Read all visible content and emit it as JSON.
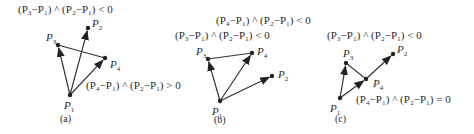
{
  "figures": [
    {
      "id": "a",
      "caption": "(a)",
      "points": {
        "P1": {
          "x": 70,
          "y": 95,
          "label": "P",
          "sub": "1"
        },
        "P2": {
          "x": 88,
          "y": 28,
          "label": "P",
          "sub": "2"
        },
        "P3": {
          "x": 58,
          "y": 45,
          "label": "P",
          "sub": "3"
        },
        "P4": {
          "x": 105,
          "y": 58,
          "label": "P",
          "sub": "4"
        }
      },
      "labels": [
        {
          "text": "(P₃−P₁) ^ (P₂−P₁) < 0",
          "x": 18,
          "y": 13
        },
        {
          "text": "(P₄−P₁) ^ (P₂−P₁) > 0",
          "x": 86,
          "y": 89
        }
      ]
    },
    {
      "id": "b",
      "caption": "(b)",
      "points": {
        "P1": {
          "x": 220,
          "y": 101,
          "label": "P",
          "sub": "1"
        },
        "P2": {
          "x": 272,
          "y": 76,
          "label": "P",
          "sub": "2"
        },
        "P3": {
          "x": 208,
          "y": 59,
          "label": "P",
          "sub": "3"
        },
        "P4": {
          "x": 252,
          "y": 53,
          "label": "P",
          "sub": "4"
        }
      },
      "labels": [
        {
          "text": "(P₄−P₁) ^ (P₂−P₁) < 0",
          "x": 216,
          "y": 24
        },
        {
          "text": "(P₃−P₁) ^ (P₂−P₁) < 0",
          "x": 175,
          "y": 39
        }
      ]
    },
    {
      "id": "c",
      "caption": "(c)",
      "points": {
        "P1": {
          "x": 340,
          "y": 98,
          "label": "P",
          "sub": "1"
        },
        "P2": {
          "x": 393,
          "y": 54,
          "label": "P",
          "sub": "2"
        },
        "P3": {
          "x": 346,
          "y": 63,
          "label": "P",
          "sub": "3"
        },
        "P4": {
          "x": 366,
          "y": 79,
          "label": "P",
          "sub": "4"
        }
      },
      "labels": [
        {
          "text": "(P₃−P₁) ^ (P₂−P₁) < 0",
          "x": 327,
          "y": 39
        },
        {
          "text": "(P₄−P₁) ^ (P₂−P₁) = 0",
          "x": 356,
          "y": 103
        }
      ]
    }
  ]
}
